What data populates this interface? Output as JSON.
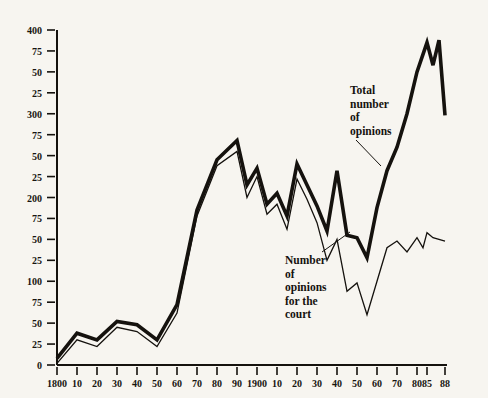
{
  "figure": {
    "background_color": "#f7f5f0",
    "ink_color": "#15120e"
  },
  "chart_data": {
    "type": "line",
    "title": "",
    "subtitle": "",
    "xlabel": "",
    "ylabel": "",
    "grid": false,
    "legend_position": "inline-annotations",
    "xlim": [
      1800,
      1988
    ],
    "ylim": [
      0,
      400
    ],
    "x_tick_labels": [
      "1800",
      "10",
      "20",
      "30",
      "40",
      "50",
      "60",
      "70",
      "80",
      "90",
      "1900",
      "10",
      "20",
      "30",
      "40",
      "50",
      "60",
      "70",
      "80",
      "85",
      "88"
    ],
    "x_tick_values": [
      1800,
      1810,
      1820,
      1830,
      1840,
      1850,
      1860,
      1870,
      1880,
      1890,
      1900,
      1910,
      1920,
      1930,
      1940,
      1950,
      1960,
      1970,
      1980,
      1985,
      1988
    ],
    "y_tick_labels": [
      "0",
      "25",
      "50",
      "75",
      "100",
      "25",
      "50",
      "75",
      "200",
      "25",
      "50",
      "75",
      "300",
      "25",
      "50",
      "75",
      "400"
    ],
    "y_tick_values": [
      0,
      25,
      50,
      75,
      100,
      125,
      150,
      175,
      200,
      225,
      250,
      275,
      300,
      325,
      350,
      375,
      400
    ],
    "series": [
      {
        "name": "Total number of opinions",
        "style": "thick",
        "annotation": "Total\nnumber\nof\nopinions",
        "x": [
          1800,
          1810,
          1820,
          1830,
          1840,
          1850,
          1860,
          1870,
          1880,
          1890,
          1895,
          1900,
          1905,
          1910,
          1915,
          1920,
          1925,
          1930,
          1935,
          1940,
          1945,
          1950,
          1955,
          1960,
          1965,
          1970,
          1975,
          1980,
          1985,
          1986,
          1987,
          1988
        ],
        "values": [
          8,
          38,
          30,
          52,
          48,
          30,
          72,
          185,
          245,
          268,
          215,
          235,
          192,
          205,
          178,
          240,
          215,
          190,
          160,
          232,
          155,
          152,
          128,
          188,
          232,
          260,
          300,
          350,
          385,
          358,
          388,
          298
        ]
      },
      {
        "name": "Number of opinions for the court",
        "style": "thin",
        "annotation": "Number\nof\nopinions\nfor the\ncourt",
        "x": [
          1800,
          1810,
          1820,
          1830,
          1840,
          1850,
          1860,
          1870,
          1880,
          1890,
          1895,
          1900,
          1905,
          1910,
          1915,
          1920,
          1925,
          1930,
          1935,
          1940,
          1945,
          1950,
          1955,
          1960,
          1965,
          1970,
          1975,
          1980,
          1983,
          1985,
          1986,
          1988
        ],
        "values": [
          2,
          30,
          22,
          45,
          40,
          22,
          62,
          178,
          238,
          255,
          200,
          225,
          180,
          192,
          162,
          222,
          198,
          170,
          125,
          150,
          88,
          98,
          60,
          100,
          140,
          148,
          135,
          152,
          140,
          158,
          152,
          148
        ]
      }
    ],
    "annotations": [
      {
        "name": "total-opinions-annotation",
        "text": "Total\nnumber\nof\nopinions",
        "label_x_px": 350,
        "label_y_px": 84,
        "leader_from_px": [
          356,
          140
        ],
        "leader_to_px": [
          381,
          166
        ]
      },
      {
        "name": "court-opinions-annotation",
        "text": "Number\nof\nopinions\nfor the\ncourt",
        "label_x_px": 285,
        "label_y_px": 254,
        "leader_from_px": [
          322,
          252
        ],
        "leader_to_px": [
          350,
          232
        ]
      }
    ]
  }
}
